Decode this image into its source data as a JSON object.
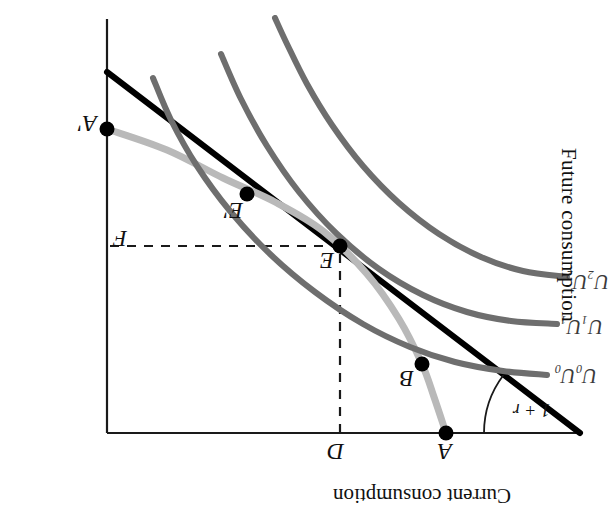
{
  "figure": {
    "title_axis_top": "Current consumption",
    "title_axis_right": "Future consumption",
    "rate_label": "1 + r",
    "background_color": "#ffffff",
    "budget_line_color": "#000000",
    "ppf_color": "#b9b9b9",
    "indifference_color": "#6e6e6e",
    "axis_color": "#1a1a1a",
    "dash_color": "#1a1a1a"
  },
  "points": [
    {
      "id": "A",
      "label": "A",
      "x": 169,
      "y": 81,
      "dot": true,
      "label_dx": -6,
      "label_dy": -30
    },
    {
      "id": "B",
      "label": "B",
      "x": 193,
      "y": 150,
      "dot": true,
      "label_dx": 8,
      "label_dy": -26
    },
    {
      "id": "E",
      "label": "E",
      "x": 275,
      "y": 268,
      "dot": true,
      "label_dx": 6,
      "label_dy": -26
    },
    {
      "id": "Ep",
      "label": "E'",
      "x": 368,
      "y": 320,
      "dot": true,
      "label_dx": 4,
      "label_dy": -28
    },
    {
      "id": "Ap",
      "label": "A'",
      "x": 508,
      "y": 385,
      "dot": true,
      "label_dx": 10,
      "label_dy": -6
    },
    {
      "id": "D",
      "label": "D",
      "x": 275,
      "y": 81,
      "dot": false,
      "label_dx": -4,
      "label_dy": -30
    },
    {
      "id": "F",
      "label": "F",
      "x": 508,
      "y": 268,
      "dot": false,
      "label_dx": -20,
      "label_dy": -4
    }
  ],
  "curve_labels": [
    {
      "id": "U0",
      "base": "U",
      "sub": "0",
      "text": "U₀U₀",
      "x": 18,
      "y": 128
    },
    {
      "id": "U1",
      "base": "U",
      "sub": "1",
      "text": "U₁U₁",
      "x": 12,
      "y": 177
    },
    {
      "id": "U2",
      "base": "U",
      "sub": "2",
      "text": "U₂U₂",
      "x": 6,
      "y": 222
    }
  ],
  "chart_data": {
    "type": "line",
    "xlabel": "Current consumption",
    "ylabel": "Future consumption",
    "orientation": "rotated-180",
    "grid": false,
    "legend": "none",
    "axes": {
      "top_axis": {
        "from": [
          35,
          81
        ],
        "to": [
          508,
          81
        ]
      },
      "right_axis": {
        "from": [
          508,
          81
        ],
        "to": [
          508,
          495
        ]
      }
    },
    "series": [
      {
        "name": "Budget line (slope 1 + r)",
        "style": "solid-black",
        "color": "#000000",
        "width": 6,
        "points": [
          [
            35,
            81
          ],
          [
            508,
            442
          ]
        ]
      },
      {
        "name": "Production possibility frontier",
        "style": "solid-lightgray",
        "color": "#b9b9b9",
        "width": 7,
        "points": [
          [
            169,
            81
          ],
          [
            181,
            117
          ],
          [
            193,
            150
          ],
          [
            216,
            195
          ],
          [
            248,
            240
          ],
          [
            292,
            283
          ],
          [
            340,
            312
          ],
          [
            392,
            336
          ],
          [
            448,
            364
          ],
          [
            508,
            385
          ]
        ]
      },
      {
        "name": "U0U0",
        "style": "solid-gray",
        "color": "#6e6e6e",
        "width": 6,
        "points": [
          [
            68,
            139
          ],
          [
            112,
            143
          ],
          [
            160,
            152
          ],
          [
            205,
            167
          ],
          [
            252,
            190
          ],
          [
            300,
            222
          ],
          [
            345,
            260
          ],
          [
            385,
            303
          ],
          [
            418,
            348
          ],
          [
            444,
            394
          ],
          [
            462,
            436
          ]
        ]
      },
      {
        "name": "U1U1",
        "style": "solid-gray",
        "color": "#6e6e6e",
        "width": 6,
        "points": [
          [
            58,
            190
          ],
          [
            104,
            193
          ],
          [
            148,
            202
          ],
          [
            192,
            219
          ],
          [
            236,
            245
          ],
          [
            278,
            280
          ],
          [
            316,
            322
          ],
          [
            348,
            368
          ],
          [
            374,
            415
          ],
          [
            394,
            460
          ]
        ]
      },
      {
        "name": "U2U2",
        "style": "solid-gray",
        "color": "#6e6e6e",
        "width": 6,
        "points": [
          [
            48,
            237
          ],
          [
            92,
            243
          ],
          [
            134,
            257
          ],
          [
            176,
            280
          ],
          [
            216,
            311
          ],
          [
            252,
            348
          ],
          [
            283,
            389
          ],
          [
            308,
            430
          ],
          [
            328,
            470
          ],
          [
            340,
            496
          ]
        ]
      }
    ],
    "guides": [
      {
        "name": "D-vertical-dashed",
        "from": [
          275,
          81
        ],
        "to": [
          275,
          268
        ],
        "dash": "9 8"
      },
      {
        "name": "F-horizontal-dashed",
        "from": [
          275,
          268
        ],
        "to": [
          508,
          268
        ],
        "dash": "9 8"
      }
    ],
    "annotations": [
      {
        "name": "rate-arc",
        "text": "1 + r",
        "center": [
          35,
          81
        ],
        "radius": 96,
        "from_deg": 0,
        "to_deg": 37
      }
    ]
  }
}
